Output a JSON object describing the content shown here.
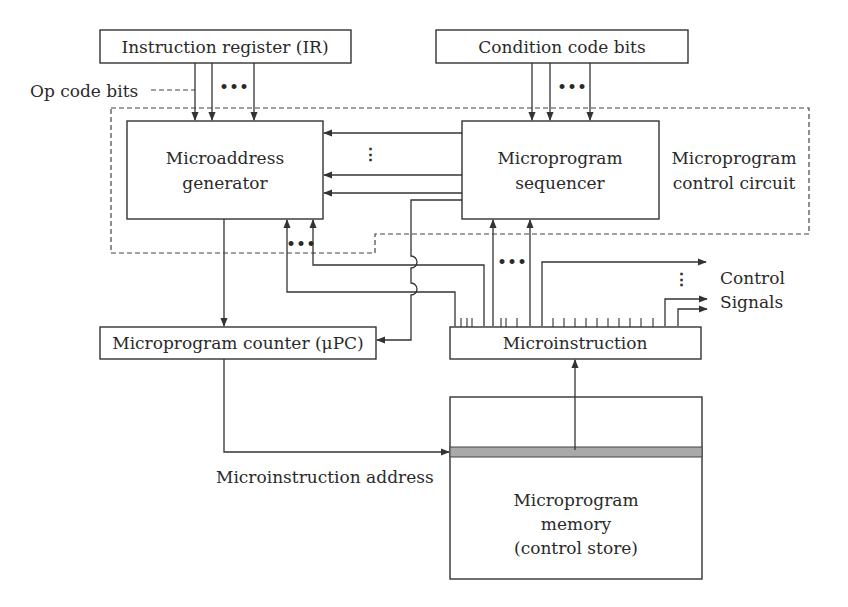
{
  "diagram": {
    "type": "block-diagram",
    "blocks": {
      "instruction_register": "Instruction register (IR)",
      "condition_code_bits": "Condition code bits",
      "microaddress_generator": [
        "Microaddress",
        "generator"
      ],
      "microprogram_sequencer": [
        "Microprogram",
        "sequencer"
      ],
      "microprogram_counter": "Microprogram counter (μPC)",
      "microinstruction": "Microinstruction",
      "microprogram_memory": [
        "Microprogram",
        "memory",
        "(control store)"
      ]
    },
    "labels": {
      "op_code_bits": "Op code bits",
      "control_circuit": [
        "Microprogram",
        "control circuit"
      ],
      "control_signals": [
        "Control",
        "Signals"
      ],
      "microinstruction_address": "Microinstruction address"
    },
    "ellipsis": {
      "horizontal": "•••",
      "vertical": "⋮"
    },
    "colors": {
      "line": "#333333",
      "text": "#2a2a2a",
      "highlight_row": "#a9a9a9",
      "background": "#ffffff"
    }
  }
}
